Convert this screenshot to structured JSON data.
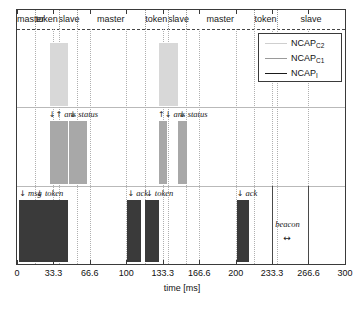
{
  "figure": {
    "xlabel": "time [ms]",
    "xticks": [
      "0",
      "33.3",
      "66.6",
      "100",
      "133.3",
      "166.6",
      "200",
      "233.3",
      "266.6",
      "300"
    ],
    "xlim": [
      0,
      300
    ]
  },
  "header": {
    "cells": [
      {
        "label": "master",
        "start": 0,
        "end": 16.66
      },
      {
        "label": "token",
        "start": 16.66,
        "end": 38.0
      },
      {
        "label": "slave",
        "start": 38.0,
        "end": 55.0
      },
      {
        "label": "master",
        "start": 55.0,
        "end": 116.66
      },
      {
        "label": "token",
        "start": 116.66,
        "end": 138.0
      },
      {
        "label": "slave",
        "start": 138.0,
        "end": 155.0
      },
      {
        "label": "master",
        "start": 155.0,
        "end": 216.66
      },
      {
        "label": "token",
        "start": 216.66,
        "end": 238.0
      },
      {
        "label": "slave",
        "start": 238.0,
        "end": 300.0
      }
    ]
  },
  "legend": {
    "entries": [
      {
        "name": "NCAP",
        "sub": "C2",
        "color": "#cfcfcf"
      },
      {
        "name": "NCAP",
        "sub": "C1",
        "color": "#9a9a9a"
      },
      {
        "name": "NCAP",
        "sub": "I",
        "color": "#1a1a1a"
      }
    ]
  },
  "chart_data": {
    "type": "line",
    "title": "",
    "xlabel": "time [ms]",
    "ylabel": "",
    "xlim": [
      0,
      300
    ],
    "grid": true,
    "legend_position": "top-right",
    "rows": [
      {
        "name": "NCAP_C2",
        "color": "#d8d8d8",
        "annotations": [],
        "bursts": [
          {
            "start": 30.0,
            "end": 47.0,
            "density": 34
          },
          {
            "start": 130.0,
            "end": 147.0,
            "density": 34
          }
        ]
      },
      {
        "name": "NCAP_C1",
        "color": "#a8a8a8",
        "annotations": [
          {
            "text": "ans",
            "arrows": "↓↑",
            "x": 29.0
          },
          {
            "text": "status",
            "arrows": "↓",
            "x": 48.0
          },
          {
            "text": "ans",
            "arrows": "↑↓",
            "x": 129.0
          },
          {
            "text": "status",
            "arrows": "↓",
            "x": 148.0
          }
        ],
        "bursts": [
          {
            "start": 30.0,
            "end": 47.0,
            "density": 26
          },
          {
            "start": 47.5,
            "end": 64.0,
            "density": 26
          },
          {
            "start": 130.0,
            "end": 137.5,
            "density": 12
          },
          {
            "start": 147.5,
            "end": 156.0,
            "density": 13
          }
        ]
      },
      {
        "name": "NCAP_I",
        "color": "#3a3a3a",
        "annotations": [
          {
            "text": "msg",
            "arrows": "↓",
            "x": 2.0
          },
          {
            "text": "token",
            "arrows": "↓",
            "x": 17.5
          },
          {
            "text": "ack",
            "arrows": "↓",
            "x": 101.0
          },
          {
            "text": "token",
            "arrows": "↓",
            "x": 118.0
          },
          {
            "text": "ack",
            "arrows": "↓",
            "x": 201.0
          }
        ],
        "bursts": [
          {
            "start": 1.5,
            "end": 30.0,
            "density": 46
          },
          {
            "start": 30.5,
            "end": 47.0,
            "density": 30
          },
          {
            "start": 101.0,
            "end": 114.0,
            "density": 21
          },
          {
            "start": 117.0,
            "end": 130.0,
            "density": 21
          },
          {
            "start": 201.0,
            "end": 212.0,
            "density": 17
          }
        ]
      }
    ],
    "beacon": {
      "label": "beacon",
      "arrow": "↔",
      "start": 233.3,
      "end": 266.6
    },
    "markers": [
      {
        "x": 216.66,
        "label": "token-boundary"
      },
      {
        "x": 233.3,
        "label": "beacon-start"
      },
      {
        "x": 266.6,
        "label": "beacon-end"
      }
    ]
  }
}
